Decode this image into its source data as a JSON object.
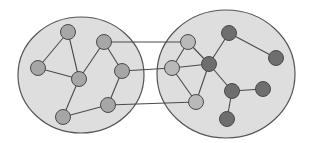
{
  "colors": {
    "background": "#ffffff",
    "cluster_fill": "#dedede",
    "cluster_stroke": "#555555",
    "edge": "#4a4a4a",
    "node_light": "#b9b9b9",
    "node_mid": "#a6a6a6",
    "node_dark": "#6e6e6e",
    "node_stroke": "#4a4a4a"
  },
  "clusters": [
    {
      "id": "left-cluster",
      "cx": 81,
      "cy": 75,
      "rx": 63,
      "ry": 58
    },
    {
      "id": "right-cluster",
      "cx": 226,
      "cy": 74,
      "rx": 69,
      "ry": 64
    }
  ],
  "nodes": [
    {
      "id": "A",
      "cluster": "left",
      "x": 68,
      "y": 32,
      "tone": "mid"
    },
    {
      "id": "B",
      "cluster": "left",
      "x": 104,
      "y": 42,
      "tone": "mid"
    },
    {
      "id": "C",
      "cluster": "left",
      "x": 38,
      "y": 68,
      "tone": "mid"
    },
    {
      "id": "D",
      "cluster": "left",
      "x": 79,
      "y": 79,
      "tone": "mid"
    },
    {
      "id": "E",
      "cluster": "left",
      "x": 122,
      "y": 71,
      "tone": "mid"
    },
    {
      "id": "F",
      "cluster": "left",
      "x": 108,
      "y": 105,
      "tone": "mid"
    },
    {
      "id": "G",
      "cluster": "left",
      "x": 63,
      "y": 117,
      "tone": "mid"
    },
    {
      "id": "H",
      "cluster": "right",
      "x": 188,
      "y": 42,
      "tone": "light"
    },
    {
      "id": "I",
      "cluster": "right",
      "x": 172,
      "y": 68,
      "tone": "light"
    },
    {
      "id": "J",
      "cluster": "right",
      "x": 196,
      "y": 102,
      "tone": "light"
    },
    {
      "id": "K",
      "cluster": "right",
      "x": 209,
      "y": 64,
      "tone": "dark"
    },
    {
      "id": "L",
      "cluster": "right",
      "x": 229,
      "y": 33,
      "tone": "dark"
    },
    {
      "id": "M",
      "cluster": "right",
      "x": 276,
      "y": 58,
      "tone": "dark"
    },
    {
      "id": "N",
      "cluster": "right",
      "x": 232,
      "y": 91,
      "tone": "dark"
    },
    {
      "id": "O",
      "cluster": "right",
      "x": 263,
      "y": 89,
      "tone": "dark"
    },
    {
      "id": "P",
      "cluster": "right",
      "x": 227,
      "y": 119,
      "tone": "dark"
    }
  ],
  "edges": [
    [
      "A",
      "C"
    ],
    [
      "A",
      "D"
    ],
    [
      "C",
      "D"
    ],
    [
      "D",
      "B"
    ],
    [
      "D",
      "G"
    ],
    [
      "B",
      "E"
    ],
    [
      "E",
      "F"
    ],
    [
      "F",
      "G"
    ],
    [
      "B",
      "H"
    ],
    [
      "E",
      "I"
    ],
    [
      "F",
      "J"
    ],
    [
      "H",
      "I"
    ],
    [
      "H",
      "K"
    ],
    [
      "I",
      "K"
    ],
    [
      "I",
      "J"
    ],
    [
      "J",
      "K"
    ],
    [
      "K",
      "L"
    ],
    [
      "L",
      "M"
    ],
    [
      "K",
      "N"
    ],
    [
      "N",
      "O"
    ],
    [
      "N",
      "P"
    ]
  ],
  "node_radius": 7.5
}
